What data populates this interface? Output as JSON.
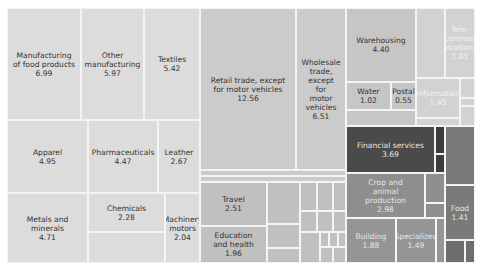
{
  "chart_data": {
    "type": "treemap",
    "title": "",
    "legend": "none",
    "groups": [
      {
        "name": "Manufacturing",
        "color": "#dcdcdc"
      },
      {
        "name": "Trade",
        "color": "#cbcbcb"
      },
      {
        "name": "Services",
        "color": "#c0c0c0"
      },
      {
        "name": "Transport & utilities",
        "color": "#c6c6c6"
      },
      {
        "name": "Information & communications",
        "color": "#d2d2d2"
      },
      {
        "name": "Finance",
        "color": "#4a4a4a"
      },
      {
        "name": "Agriculture & construction",
        "color": "#8e8e8e"
      }
    ],
    "cells": [
      {
        "id": "food-mfg",
        "label": "Manufacturing\nof food products",
        "value": 6.99,
        "x": 7,
        "y": 8,
        "w": 74,
        "h": 112,
        "color": "#dcdcdc",
        "text": "#333333"
      },
      {
        "id": "other-mfg",
        "label": "Other\nmanufacturing",
        "value": 5.97,
        "x": 81,
        "y": 8,
        "w": 63,
        "h": 112,
        "color": "#dcdcdc",
        "text": "#333333"
      },
      {
        "id": "textiles",
        "label": "Textiles",
        "value": 5.42,
        "x": 144,
        "y": 8,
        "w": 56,
        "h": 112,
        "color": "#dcdcdc",
        "text": "#333333"
      },
      {
        "id": "apparel",
        "label": "Apparel",
        "value": 4.95,
        "x": 7,
        "y": 120,
        "w": 81,
        "h": 73,
        "color": "#dcdcdc",
        "text": "#333333"
      },
      {
        "id": "pharma",
        "label": "Pharmaceuticals",
        "value": 4.47,
        "x": 88,
        "y": 120,
        "w": 70,
        "h": 73,
        "color": "#dcdcdc",
        "text": "#333333"
      },
      {
        "id": "leather",
        "label": "Leather",
        "value": 2.67,
        "x": 158,
        "y": 120,
        "w": 42,
        "h": 73,
        "color": "#dcdcdc",
        "text": "#333333"
      },
      {
        "id": "metals",
        "label": "Metals and\nminerals",
        "value": 4.71,
        "x": 7,
        "y": 193,
        "w": 81,
        "h": 70,
        "color": "#dcdcdc",
        "text": "#333333"
      },
      {
        "id": "chemicals",
        "label": "Chemicals",
        "value": 2.28,
        "x": 88,
        "y": 193,
        "w": 77,
        "h": 39,
        "color": "#dcdcdc",
        "text": "#333333"
      },
      {
        "id": "mfg-unlabeled-1",
        "label": "",
        "value": null,
        "x": 88,
        "y": 232,
        "w": 77,
        "h": 31,
        "color": "#dcdcdc",
        "text": "#333333"
      },
      {
        "id": "machinery",
        "label": "Machinery\nmotors",
        "value": 2.04,
        "x": 165,
        "y": 193,
        "w": 35,
        "h": 70,
        "color": "#dcdcdc",
        "text": "#333333"
      },
      {
        "id": "retail",
        "label": "Retail trade, except\nfor motor vehicles",
        "value": 12.56,
        "x": 200,
        "y": 8,
        "w": 96,
        "h": 162,
        "color": "#cbcbcb",
        "text": "#333333"
      },
      {
        "id": "wholesale",
        "label": "Wholesale\ntrade,\nexcept\nfor\nmotor\nvehicles",
        "value": 6.51,
        "x": 296,
        "y": 8,
        "w": 50,
        "h": 162,
        "color": "#cbcbcb",
        "text": "#333333"
      },
      {
        "id": "trade-strip-1",
        "label": "",
        "value": null,
        "x": 200,
        "y": 170,
        "w": 146,
        "h": 6,
        "color": "#cbcbcb",
        "text": "#333333"
      },
      {
        "id": "trade-strip-2",
        "label": "",
        "value": null,
        "x": 200,
        "y": 176,
        "w": 146,
        "h": 6,
        "color": "#cbcbcb",
        "text": "#333333"
      },
      {
        "id": "travel",
        "label": "Travel",
        "value": 2.51,
        "x": 200,
        "y": 182,
        "w": 67,
        "h": 44,
        "color": "#c0c0c0",
        "text": "#333333"
      },
      {
        "id": "education",
        "label": "Education\nand health",
        "value": 1.96,
        "x": 200,
        "y": 226,
        "w": 67,
        "h": 37,
        "color": "#c0c0c0",
        "text": "#333333"
      },
      {
        "id": "svc-1",
        "label": "",
        "value": null,
        "x": 267,
        "y": 182,
        "w": 33,
        "h": 42,
        "color": "#c0c0c0",
        "text": "#333333"
      },
      {
        "id": "svc-2",
        "label": "",
        "value": null,
        "x": 267,
        "y": 224,
        "w": 33,
        "h": 24,
        "color": "#c0c0c0",
        "text": "#333333"
      },
      {
        "id": "svc-3",
        "label": "",
        "value": null,
        "x": 267,
        "y": 248,
        "w": 33,
        "h": 15,
        "color": "#c0c0c0",
        "text": "#333333"
      },
      {
        "id": "svc-4",
        "label": "",
        "value": null,
        "x": 300,
        "y": 182,
        "w": 17,
        "h": 29,
        "color": "#c0c0c0",
        "text": "#333333"
      },
      {
        "id": "svc-5",
        "label": "",
        "value": null,
        "x": 317,
        "y": 182,
        "w": 16,
        "h": 29,
        "color": "#c0c0c0",
        "text": "#333333"
      },
      {
        "id": "svc-6",
        "label": "",
        "value": null,
        "x": 333,
        "y": 182,
        "w": 13,
        "h": 29,
        "color": "#c0c0c0",
        "text": "#333333"
      },
      {
        "id": "svc-7",
        "label": "",
        "value": null,
        "x": 300,
        "y": 211,
        "w": 17,
        "h": 21,
        "color": "#c0c0c0",
        "text": "#333333"
      },
      {
        "id": "svc-8",
        "label": "",
        "value": null,
        "x": 317,
        "y": 211,
        "w": 16,
        "h": 21,
        "color": "#c0c0c0",
        "text": "#333333"
      },
      {
        "id": "svc-9",
        "label": "",
        "value": null,
        "x": 333,
        "y": 211,
        "w": 13,
        "h": 21,
        "color": "#c0c0c0",
        "text": "#333333"
      },
      {
        "id": "svc-10",
        "label": "",
        "value": null,
        "x": 300,
        "y": 232,
        "w": 20,
        "h": 31,
        "color": "#c0c0c0",
        "text": "#333333"
      },
      {
        "id": "svc-11",
        "label": "",
        "value": null,
        "x": 320,
        "y": 232,
        "w": 9,
        "h": 15,
        "color": "#c0c0c0",
        "text": "#333333"
      },
      {
        "id": "svc-12",
        "label": "",
        "value": null,
        "x": 329,
        "y": 232,
        "w": 9,
        "h": 15,
        "color": "#c0c0c0",
        "text": "#333333"
      },
      {
        "id": "svc-13",
        "label": "",
        "value": null,
        "x": 338,
        "y": 232,
        "w": 8,
        "h": 15,
        "color": "#c0c0c0",
        "text": "#333333"
      },
      {
        "id": "svc-14",
        "label": "",
        "value": null,
        "x": 320,
        "y": 247,
        "w": 13,
        "h": 16,
        "color": "#c0c0c0",
        "text": "#333333"
      },
      {
        "id": "svc-15",
        "label": "",
        "value": null,
        "x": 333,
        "y": 247,
        "w": 13,
        "h": 16,
        "color": "#c0c0c0",
        "text": "#333333"
      },
      {
        "id": "warehousing",
        "label": "Warehousing",
        "value": 4.4,
        "x": 346,
        "y": 8,
        "w": 70,
        "h": 74,
        "color": "#c6c6c6",
        "text": "#333333"
      },
      {
        "id": "water",
        "label": "Water",
        "value": 1.02,
        "x": 346,
        "y": 82,
        "w": 45,
        "h": 28,
        "color": "#c6c6c6",
        "text": "#333333"
      },
      {
        "id": "postal",
        "label": "Postal",
        "value": 0.55,
        "x": 391,
        "y": 82,
        "w": 25,
        "h": 28,
        "color": "#c6c6c6",
        "text": "#333333"
      },
      {
        "id": "transport-strip",
        "label": "",
        "value": null,
        "x": 346,
        "y": 110,
        "w": 70,
        "h": 16,
        "color": "#c6c6c6",
        "text": "#333333"
      },
      {
        "id": "info-unlabeled",
        "label": "",
        "value": null,
        "x": 416,
        "y": 8,
        "w": 29,
        "h": 70,
        "color": "#d2d2d2",
        "text": "#f2f2f2"
      },
      {
        "id": "telecom",
        "label": "Tele-\ncommu-\nnications",
        "value": 1.81,
        "x": 445,
        "y": 8,
        "w": 30,
        "h": 70,
        "color": "#d2d2d2",
        "text": "#f2f2f2"
      },
      {
        "id": "information",
        "label": "Information",
        "value": 1.45,
        "x": 416,
        "y": 78,
        "w": 44,
        "h": 40,
        "color": "#d2d2d2",
        "text": "#f2f2f2"
      },
      {
        "id": "info-small-1",
        "label": "",
        "value": null,
        "x": 460,
        "y": 78,
        "w": 15,
        "h": 20,
        "color": "#d2d2d2",
        "text": "#f2f2f2"
      },
      {
        "id": "info-small-2",
        "label": "",
        "value": null,
        "x": 460,
        "y": 98,
        "w": 15,
        "h": 8,
        "color": "#d2d2d2",
        "text": "#f2f2f2"
      },
      {
        "id": "info-small-3",
        "label": "",
        "value": null,
        "x": 460,
        "y": 106,
        "w": 15,
        "h": 20,
        "color": "#d2d2d2",
        "text": "#f2f2f2"
      },
      {
        "id": "info-strip",
        "label": "",
        "value": null,
        "x": 416,
        "y": 118,
        "w": 44,
        "h": 8,
        "color": "#d2d2d2",
        "text": "#f2f2f2"
      },
      {
        "id": "financial",
        "label": "Financial services",
        "value": 3.69,
        "x": 346,
        "y": 126,
        "w": 89,
        "h": 47,
        "color": "#4a4a4a",
        "text": "#e6e6e6"
      },
      {
        "id": "fin-small-1",
        "label": "",
        "value": null,
        "x": 435,
        "y": 126,
        "w": 10,
        "h": 28,
        "color": "#3d3d3d",
        "text": "#e6e6e6"
      },
      {
        "id": "fin-small-2",
        "label": "",
        "value": null,
        "x": 435,
        "y": 154,
        "w": 10,
        "h": 19,
        "color": "#3d3d3d",
        "text": "#e6e6e6"
      },
      {
        "id": "fin-right",
        "label": "",
        "value": null,
        "x": 445,
        "y": 126,
        "w": 30,
        "h": 59,
        "color": "#7a7a7a",
        "text": "#e6e6e6"
      },
      {
        "id": "crop",
        "label": "Crop and\nanimal\nproduction",
        "value": 2.98,
        "x": 346,
        "y": 173,
        "w": 79,
        "h": 45,
        "color": "#8e8e8e",
        "text": "#e6e6e6"
      },
      {
        "id": "agri-small-1",
        "label": "",
        "value": null,
        "x": 425,
        "y": 173,
        "w": 20,
        "h": 30,
        "color": "#8e8e8e",
        "text": "#e6e6e6"
      },
      {
        "id": "agri-small-2",
        "label": "",
        "value": null,
        "x": 425,
        "y": 203,
        "w": 20,
        "h": 15,
        "color": "#8e8e8e",
        "text": "#e6e6e6"
      },
      {
        "id": "building",
        "label": "Building",
        "value": 1.88,
        "x": 346,
        "y": 218,
        "w": 50,
        "h": 45,
        "color": "#959595",
        "text": "#e6e6e6"
      },
      {
        "id": "specialized",
        "label": "Specialized",
        "value": 1.49,
        "x": 396,
        "y": 218,
        "w": 40,
        "h": 45,
        "color": "#959595",
        "text": "#e6e6e6"
      },
      {
        "id": "constr-small",
        "label": "",
        "value": null,
        "x": 436,
        "y": 218,
        "w": 9,
        "h": 45,
        "color": "#959595",
        "text": "#e6e6e6"
      },
      {
        "id": "food",
        "label": "Food",
        "value": 1.41,
        "x": 445,
        "y": 185,
        "w": 30,
        "h": 55,
        "color": "#7a7a7a",
        "text": "#e6e6e6"
      },
      {
        "id": "food-small-1",
        "label": "",
        "value": null,
        "x": 445,
        "y": 240,
        "w": 20,
        "h": 23,
        "color": "#6e6e6e",
        "text": "#e6e6e6"
      },
      {
        "id": "food-small-2",
        "label": "",
        "value": null,
        "x": 465,
        "y": 240,
        "w": 10,
        "h": 23,
        "color": "#6e6e6e",
        "text": "#e6e6e6"
      }
    ]
  }
}
